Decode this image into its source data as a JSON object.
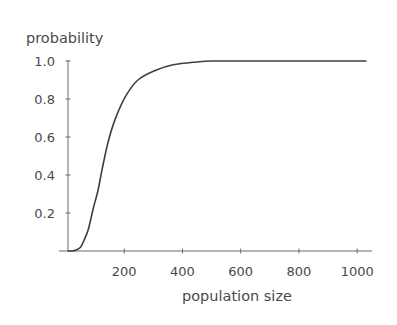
{
  "chart_data": {
    "type": "line",
    "title": "",
    "xlabel": "population size",
    "ylabel": "probability",
    "xlim": [
      0,
      1030
    ],
    "ylim": [
      0,
      1.0
    ],
    "grid": false,
    "legend": null,
    "x_ticks": [
      200,
      400,
      600,
      800,
      1000
    ],
    "x_tick_labels": [
      "200",
      "400",
      "600",
      "800",
      "1000"
    ],
    "y_ticks": [
      0.2,
      0.4,
      0.6,
      0.8,
      1.0
    ],
    "y_tick_labels": [
      "0.2",
      "0.4",
      "0.6",
      "0.8",
      "1.0"
    ],
    "series": [
      {
        "name": "probability",
        "color": "#3f3f3f",
        "x": [
          0,
          20,
          35,
          50,
          60,
          76,
          93,
          110,
          124,
          144,
          168,
          203,
          247,
          306,
          368,
          450,
          500,
          600,
          800,
          1030
        ],
        "y": [
          0,
          0,
          0.005,
          0.02,
          0.05,
          0.11,
          0.22,
          0.32,
          0.43,
          0.57,
          0.69,
          0.81,
          0.9,
          0.95,
          0.98,
          0.995,
          1.0,
          1.0,
          1.0,
          1.0
        ]
      }
    ]
  },
  "colors": {
    "axis": "#6b6b6b",
    "curve": "#3f3f3f",
    "text": "#4a4a4a",
    "background": "#ffffff"
  }
}
